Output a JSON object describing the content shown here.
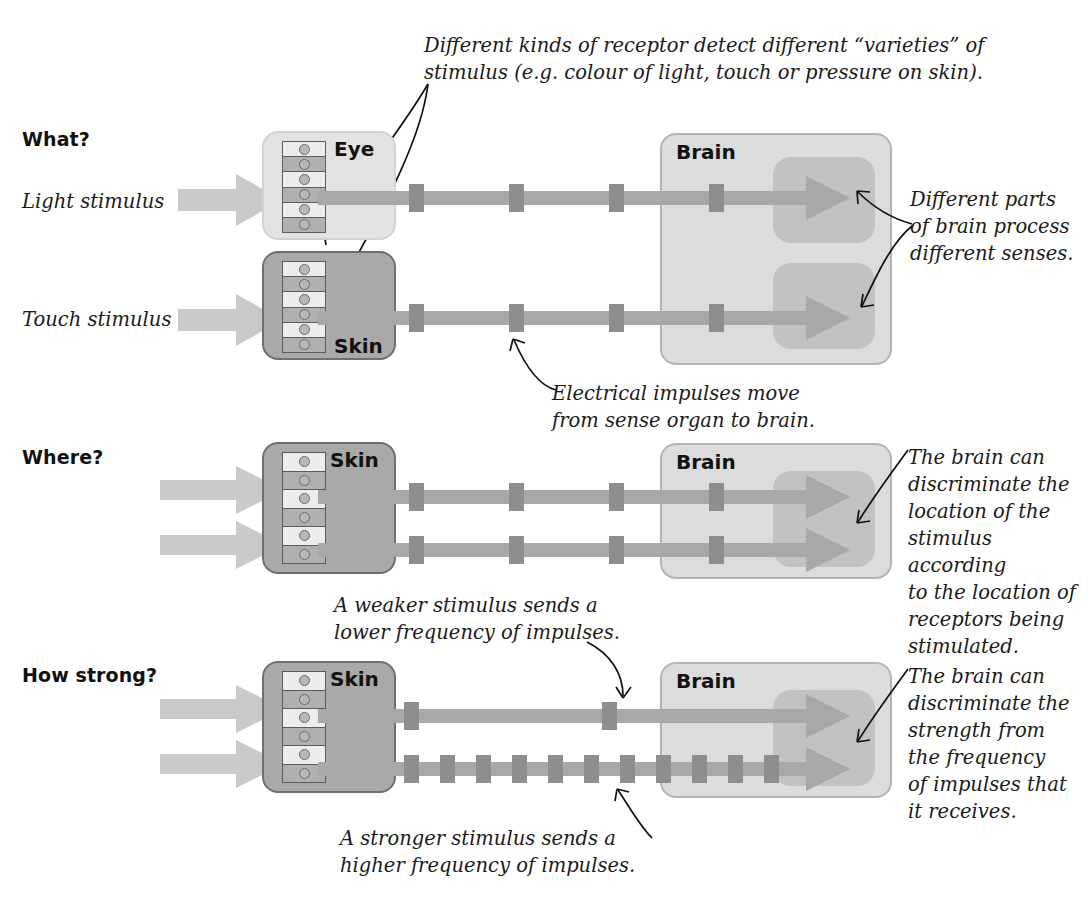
{
  "diagram": {
    "colors": {
      "stimulus_arrow": "#c9c9c9",
      "nerve": "#a8a8a8",
      "impulse": "#8e8e8e",
      "eye_box": "#e2e2e2",
      "skin_box": "#a9a9a9",
      "brain_box": "#dcdcdc",
      "brain_lobe": "#c2c2c2",
      "annotation_line": "#111111",
      "text": "#1a1a1a"
    }
  },
  "annotations": {
    "top_receptors": "Different kinds of receptor detect different “varieties” of\nstimulus (e.g. colour of light, touch or pressure on skin).",
    "top_receptors_line1": "Different kinds of receptor detect different “varieties” of",
    "top_receptors_line2": "stimulus (e.g. colour of light, touch or pressure on skin).",
    "brain_parts": "Different parts\nof brain process\ndifferent senses.",
    "impulses_move": "Electrical impulses move\nfrom sense organ to brain.",
    "where_brain": "The brain can\ndiscriminate the\nlocation of the\nstimulus according\nto the location of\nreceptors being\nstimulated.",
    "weaker_stimulus": "A weaker stimulus sends a\nlower frequency of impulses.",
    "strength_brain": "The brain can\ndiscriminate the\nstrength from\nthe frequency\nof impulses that\nit receives.",
    "stronger_stimulus": "A stronger stimulus sends a\nhigher frequency of impulses."
  },
  "rows": [
    {
      "id": "what",
      "question_label": "What?",
      "stimuli": [
        "Light stimulus",
        "Touch stimulus"
      ],
      "organs": [
        "Eye",
        "Skin"
      ],
      "brain_label": "Brain",
      "pathways": [
        {
          "stimulus": "Light stimulus",
          "organ": "Eye",
          "impulse_count": 4,
          "frequency": "normal"
        },
        {
          "stimulus": "Touch stimulus",
          "organ": "Skin",
          "impulse_count": 4,
          "frequency": "normal"
        }
      ]
    },
    {
      "id": "where",
      "question_label": "Where?",
      "stimuli": [
        "",
        ""
      ],
      "organs": [
        "Skin"
      ],
      "brain_label": "Brain",
      "pathways": [
        {
          "stimulus": "",
          "organ": "Skin",
          "impulse_count": 4,
          "frequency": "normal"
        },
        {
          "stimulus": "",
          "organ": "Skin",
          "impulse_count": 4,
          "frequency": "normal"
        }
      ]
    },
    {
      "id": "how-strong",
      "question_label": "How strong?",
      "stimuli": [
        "",
        ""
      ],
      "organs": [
        "Skin"
      ],
      "brain_label": "Brain",
      "pathways": [
        {
          "stimulus": "",
          "organ": "Skin",
          "impulse_count": 2,
          "frequency": "lower"
        },
        {
          "stimulus": "",
          "organ": "Skin",
          "impulse_count": 14,
          "frequency": "higher"
        }
      ]
    }
  ],
  "receptor_strip": {
    "cell_count": 6,
    "dot_label": "receptor"
  }
}
